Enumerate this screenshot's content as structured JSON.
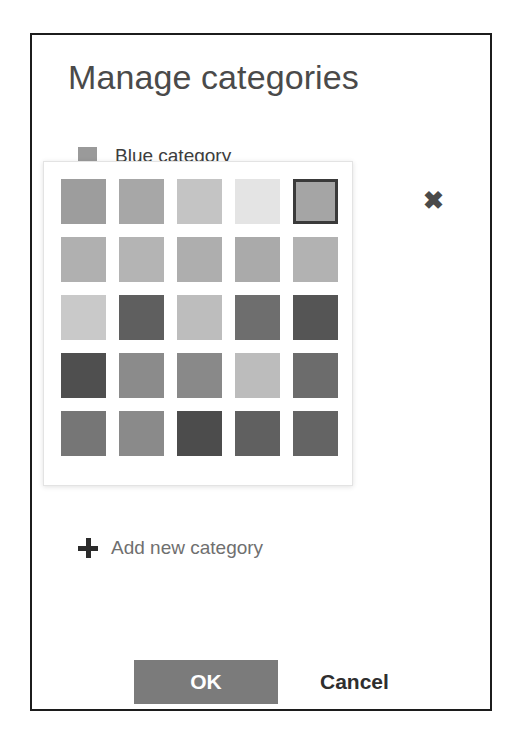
{
  "dialog": {
    "title": "Manage categories",
    "border_color": "#1c1c1c"
  },
  "categories": [
    {
      "label": "Blue category",
      "swatch_color": "#9a9a9a",
      "visible": true
    },
    {
      "label": "Green category",
      "swatch_color": "#a8a8a8",
      "visible": false
    }
  ],
  "add_category": {
    "label": "Add new category",
    "icon": "plus-icon"
  },
  "color_picker": {
    "visible": true,
    "selected_index": 4,
    "close_icon": "close-icon",
    "close_label": "✖",
    "columns": 5,
    "rows": 5,
    "swatches": [
      "#9d9d9d",
      "#a7a7a7",
      "#c4c4c4",
      "#e4e4e4",
      "#a5a5a5",
      "#b0b0b0",
      "#b4b4b4",
      "#aeaeae",
      "#aaaaaa",
      "#b2b2b2",
      "#c9c9c9",
      "#5f5f5f",
      "#bdbdbd",
      "#6e6e6e",
      "#555555",
      "#4f4f4f",
      "#8b8b8b",
      "#898989",
      "#bcbcbc",
      "#6c6c6c",
      "#767676",
      "#8a8a8a",
      "#4c4c4c",
      "#606060",
      "#646464"
    ]
  },
  "footer": {
    "ok_label": "OK",
    "ok_background": "#7b7b7b",
    "cancel_label": "Cancel"
  }
}
